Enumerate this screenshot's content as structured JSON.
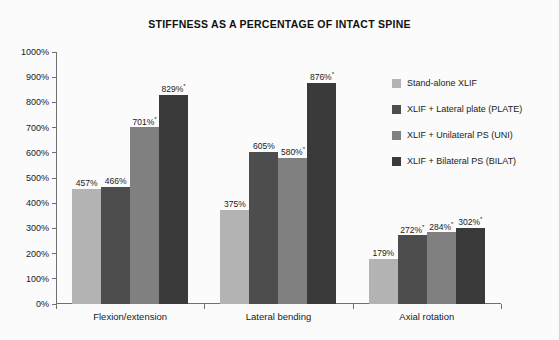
{
  "chart_data": {
    "type": "bar",
    "title": "STIFFNESS AS A PERCENTAGE OF INTACT SPINE",
    "xlabel": "",
    "ylabel": "",
    "ylim": [
      0,
      1000
    ],
    "grid": false,
    "legend_position": "right",
    "y_ticks": [
      "1000%",
      "900%",
      "800%",
      "700%",
      "600%",
      "500%",
      "400%",
      "300%",
      "200%",
      "100%",
      "0%"
    ],
    "y_tick_values": [
      1000,
      900,
      800,
      700,
      600,
      500,
      400,
      300,
      200,
      100,
      0
    ],
    "categories": [
      "Flexion/extension",
      "Lateral bending",
      "Axial rotation"
    ],
    "series": [
      {
        "name": "Stand-alone XLIF",
        "color": "#b3b3b3",
        "values": [
          457,
          375,
          179
        ],
        "labels": [
          "457%",
          "375%",
          "179%"
        ],
        "significant": [
          false,
          false,
          false
        ]
      },
      {
        "name": "XLIF + Lateral plate (PLATE)",
        "color": "#4d4d4d",
        "values": [
          466,
          605,
          272
        ],
        "labels": [
          "466%",
          "605%",
          "272%"
        ],
        "significant": [
          false,
          false,
          true
        ]
      },
      {
        "name": "XLIF + Unilateral PS (UNI)",
        "color": "#808080",
        "values": [
          701,
          580,
          284
        ],
        "labels": [
          "701%",
          "580%",
          "284%"
        ],
        "significant": [
          true,
          true,
          true
        ]
      },
      {
        "name": "XLIF + Bilateral PS (BILAT)",
        "color": "#3a3a3a",
        "values": [
          829,
          876,
          302
        ],
        "labels": [
          "829%",
          "876%",
          "302%"
        ],
        "significant": [
          true,
          true,
          true
        ]
      }
    ],
    "significance_marker": "*"
  }
}
